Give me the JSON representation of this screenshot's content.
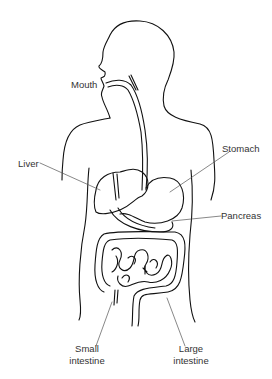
{
  "diagram": {
    "labels": {
      "mouth": "Mouth",
      "liver": "Liver",
      "stomach": "Stomach",
      "pancreas": "Pancreas",
      "small_intestine_1": "Small",
      "small_intestine_2": "intestine",
      "large_intestine_1": "Large",
      "large_intestine_2": "intestine"
    },
    "colors": {
      "line": "#111111",
      "leader": "#555555",
      "text": "#333333",
      "background": "#ffffff"
    }
  }
}
